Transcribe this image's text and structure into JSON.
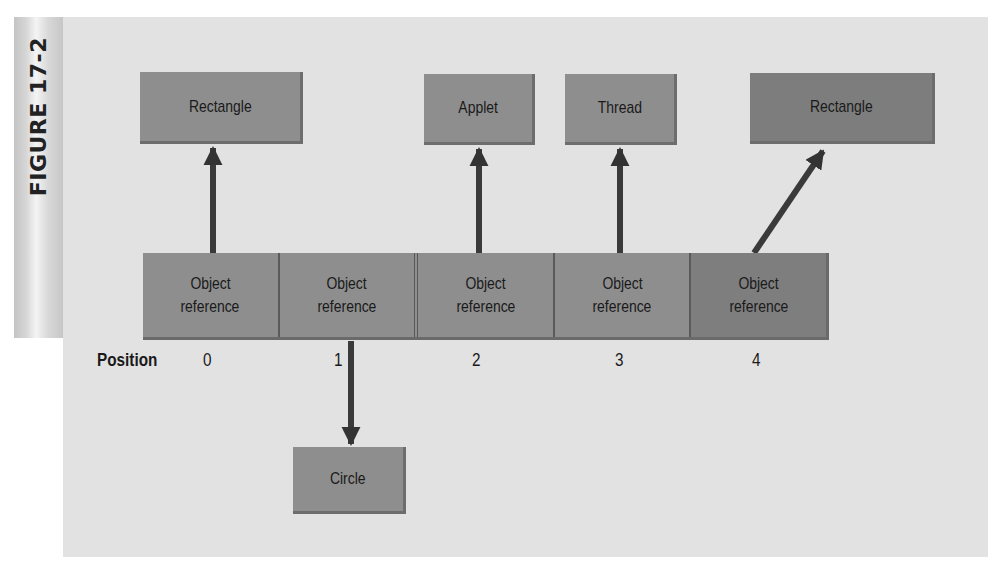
{
  "figure": {
    "label": "FIGURE 17-2"
  },
  "targets": [
    {
      "id": "rectangle-top-left",
      "label": "Rectangle"
    },
    {
      "id": "applet",
      "label": "Applet"
    },
    {
      "id": "thread",
      "label": "Thread"
    },
    {
      "id": "rectangle-top-right",
      "label": "Rectangle"
    },
    {
      "id": "circle",
      "label": "Circle"
    }
  ],
  "array": {
    "cells": [
      {
        "line1": "Object",
        "line2": "reference"
      },
      {
        "line1": "Object",
        "line2": "reference"
      },
      {
        "line1": "Object",
        "line2": "reference"
      },
      {
        "line1": "Object",
        "line2": "reference"
      },
      {
        "line1": "Object",
        "line2": "reference"
      }
    ],
    "position_label": "Position",
    "positions": [
      "0",
      "1",
      "2",
      "3",
      "4"
    ]
  },
  "colors": {
    "panel": "#e2e2e2",
    "box": "#8e8e8e",
    "arrow": "#3a3a3a"
  }
}
